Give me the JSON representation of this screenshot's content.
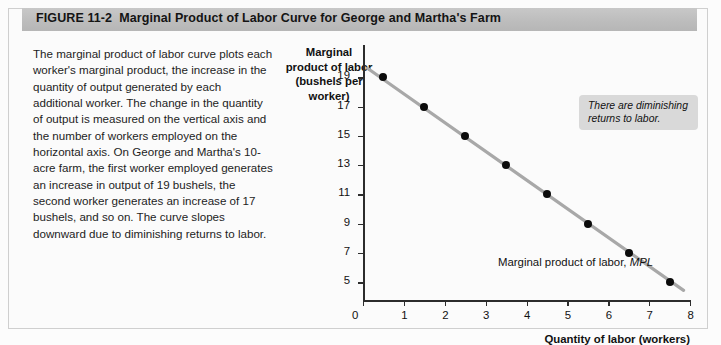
{
  "header": {
    "figure_number": "FIGURE  11-2",
    "figure_title": "Marginal Product of Labor Curve for George and Martha's Farm"
  },
  "caption": {
    "text": "The marginal product of labor curve plots each worker's marginal product, the increase in the quantity of output generated by each additional worker. The change in the quantity of output is measured on the vertical axis and the number of workers employed on the horizontal axis. On George and Martha's 10-acre farm, the first worker employed generates an increase in output of 19 bushels, the second worker generates an increase of 17 bushels, and so on. The curve slopes downward due to diminishing returns to labor."
  },
  "chart_data": {
    "type": "scatter",
    "title": "Marginal Product of Labor Curve for George and Martha's Farm",
    "xlabel": "Quantity of labor (workers)",
    "ylabel": "Marginal product of labor (bushels per worker)",
    "ylabel_lines": [
      "Marginal",
      "product of labor",
      "(bushels per",
      "worker)"
    ],
    "x": [
      0.5,
      1.5,
      2.5,
      3.5,
      4.5,
      5.5,
      6.5,
      7.5
    ],
    "values": [
      19,
      17,
      15,
      13,
      11,
      9,
      7,
      5
    ],
    "series": [
      {
        "name": "Marginal product of labor, MPL",
        "x": [
          0.5,
          1.5,
          2.5,
          3.5,
          4.5,
          5.5,
          6.5,
          7.5
        ],
        "values": [
          19,
          17,
          15,
          13,
          11,
          9,
          7,
          5
        ]
      }
    ],
    "xlim": [
      0,
      8
    ],
    "ylim": [
      3.8,
      21.2
    ],
    "xticks": [
      0,
      1,
      2,
      3,
      4,
      5,
      6,
      7,
      8
    ],
    "xtick_labels": [
      "0",
      "1",
      "2",
      "3",
      "4",
      "5",
      "6",
      "7",
      "8"
    ],
    "yticks": [
      19,
      17,
      15,
      13,
      11,
      9,
      7,
      5
    ],
    "ytick_labels": [
      "19",
      "17",
      "15",
      "13",
      "11",
      "9",
      "7",
      "5"
    ],
    "origin_label": "0",
    "grid": false,
    "legend": "none",
    "line_color": "#a8a8a8",
    "marker_color": "#0b0b0b",
    "annotations": [
      {
        "text": "There are diminishing returns to labor.",
        "style": "italic-gray-box"
      },
      {
        "text": "Marginal product of labor, MPL",
        "style": "curve-label"
      }
    ]
  },
  "curve_label": {
    "prefix": "Marginal product of labor, ",
    "abbr": "MPL"
  },
  "annotation_box": {
    "text": "There are diminishing returns to labor."
  },
  "colors": {
    "header_bar": "#bdbdbd",
    "panel_bg": "#fbfbfb",
    "axis": "#2c2c2c",
    "curve": "#a8a8a8",
    "marker": "#0b0b0b",
    "annotation_bg": "#d9d9d9"
  },
  "ghost_text": [
    "Marginal Product Curve",
    "and the change in the total"
  ]
}
